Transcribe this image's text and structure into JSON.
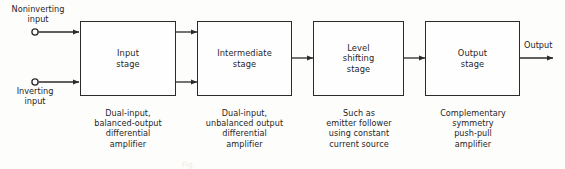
{
  "figure": {
    "bottom_note": "Fig."
  },
  "ports": {
    "noninverting_input": "Noninverting\ninput",
    "inverting_input": "Inverting\ninput",
    "output": "Output"
  },
  "stages": [
    {
      "id": "input-stage",
      "label": "Input\nstage",
      "caption": "Dual-input,\nbalanced-output\ndifferential\namplifier"
    },
    {
      "id": "intermediate-stage",
      "label": "Intermediate\nstage",
      "caption": "Dual-input,\nunbalanced output\ndifferential\namplifier"
    },
    {
      "id": "level-shifting-stage",
      "label": "Level\nshifting\nstage",
      "caption": "Such as\nemitter follower\nusing constant\ncurrent source"
    },
    {
      "id": "output-stage",
      "label": "Output\nstage",
      "caption": "Complementary\nsymmetry\npush-pull\namplifier"
    }
  ],
  "colors": {
    "line": "#2b2b2b",
    "text": "#1f1f1f",
    "background": "#fdfdfc"
  }
}
